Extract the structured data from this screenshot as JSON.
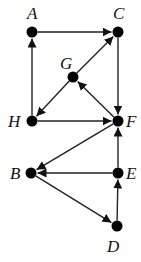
{
  "graph": {
    "type": "directed",
    "nodes": [
      {
        "id": "A",
        "label": "A",
        "x": 32,
        "y": 32,
        "lx": 27,
        "ly": 19
      },
      {
        "id": "C",
        "label": "C",
        "x": 118,
        "y": 32,
        "lx": 113,
        "ly": 19
      },
      {
        "id": "G",
        "label": "G",
        "x": 73,
        "y": 77,
        "lx": 60,
        "ly": 69
      },
      {
        "id": "H",
        "label": "H",
        "x": 32,
        "y": 121,
        "lx": 8,
        "ly": 127
      },
      {
        "id": "F",
        "label": "F",
        "x": 118,
        "y": 121,
        "lx": 126,
        "ly": 127
      },
      {
        "id": "B",
        "label": "B",
        "x": 31,
        "y": 173,
        "lx": 10,
        "ly": 179
      },
      {
        "id": "E",
        "label": "E",
        "x": 118,
        "y": 173,
        "lx": 126,
        "ly": 179
      },
      {
        "id": "D",
        "label": "D",
        "x": 117,
        "y": 226,
        "lx": 107,
        "ly": 252
      }
    ],
    "edges": [
      {
        "from": "A",
        "to": "C"
      },
      {
        "from": "H",
        "to": "A"
      },
      {
        "from": "C",
        "to": "F"
      },
      {
        "from": "H",
        "to": "F"
      },
      {
        "from": "F",
        "to": "G"
      },
      {
        "from": "G",
        "to": "C"
      },
      {
        "from": "G",
        "to": "H"
      },
      {
        "from": "F",
        "to": "B"
      },
      {
        "from": "E",
        "to": "B"
      },
      {
        "from": "E",
        "to": "F"
      },
      {
        "from": "B",
        "to": "D"
      },
      {
        "from": "D",
        "to": "E"
      }
    ]
  }
}
